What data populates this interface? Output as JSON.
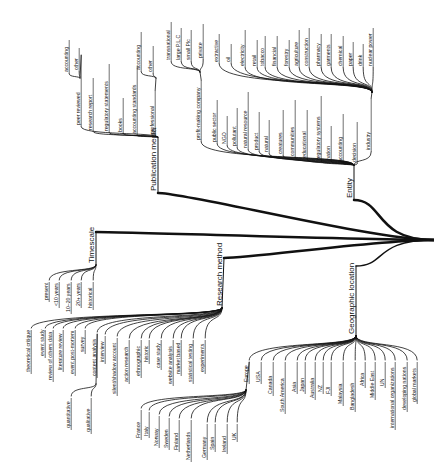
{
  "diagram": {
    "type": "mind-map-tree",
    "orientation": "rotated-90-ccw",
    "colors": {
      "line": "#111111",
      "background": "#ffffff",
      "text": "#111111"
    },
    "root": {
      "x": 434,
      "y": 240
    },
    "branches": [
      {
        "id": "publication-media",
        "label": "Publication media",
        "anchor": {
          "x": 158,
          "y": 193
        },
        "hub": {
          "x": 158,
          "y": 137
        },
        "trunk_width": 2.5,
        "children": [
          {
            "label": "peer reviewed",
            "x": 80,
            "top": 55,
            "bottom": 125,
            "children": [
              {
                "label": "accounting",
                "x": 68,
                "top": 40,
                "bottom": 72
              },
              {
                "label": "other",
                "x": 78,
                "top": 48,
                "bottom": 70
              }
            ],
            "subhub": {
              "x": 80,
              "y": 78
            }
          },
          {
            "label": "research report",
            "x": 92,
            "top": 78,
            "bottom": 130
          },
          {
            "label": "regulatory statements",
            "x": 108,
            "top": 64,
            "bottom": 131
          },
          {
            "label": "books",
            "x": 122,
            "top": 98,
            "bottom": 132
          },
          {
            "label": "accounting standards",
            "x": 136,
            "top": 66,
            "bottom": 134
          },
          {
            "label": "professional",
            "x": 154,
            "top": 90,
            "bottom": 134,
            "children": [
              {
                "label": "accounting",
                "x": 140,
                "top": 32,
                "bottom": 70
              },
              {
                "label": "other",
                "x": 152,
                "top": 46,
                "bottom": 72
              }
            ],
            "subhub": {
              "x": 156,
              "y": 78
            }
          }
        ]
      },
      {
        "id": "entity",
        "label": "Entity",
        "anchor": {
          "x": 354,
          "y": 200
        },
        "hub": {
          "x": 354,
          "y": 165
        },
        "trunk_width": 2.5,
        "children": [
          {
            "label": "profit-making company",
            "x": 200,
            "top": 80,
            "bottom": 140,
            "children": [
              {
                "label": "transnational",
                "x": 170,
                "top": 22,
                "bottom": 60
              },
              {
                "label": "large P.L.C",
                "x": 180,
                "top": 28,
                "bottom": 60
              },
              {
                "label": "small Plc",
                "x": 190,
                "top": 30,
                "bottom": 60
              },
              {
                "label": "private",
                "x": 202,
                "top": 24,
                "bottom": 58
              }
            ],
            "subhub": {
              "x": 200,
              "y": 72
            }
          },
          {
            "label": "public sector",
            "x": 216,
            "top": 100,
            "bottom": 142
          },
          {
            "label": "NGO",
            "x": 226,
            "top": 116,
            "bottom": 144
          },
          {
            "label": "pollutant",
            "x": 236,
            "top": 108,
            "bottom": 146
          },
          {
            "label": "natural resource",
            "x": 247,
            "top": 92,
            "bottom": 148
          },
          {
            "label": "product",
            "x": 258,
            "top": 112,
            "bottom": 150
          },
          {
            "label": "natural",
            "x": 268,
            "top": 120,
            "bottom": 152
          },
          {
            "label": "creatures",
            "x": 282,
            "top": 110,
            "bottom": 154
          },
          {
            "label": "communities",
            "x": 294,
            "top": 100,
            "bottom": 156
          },
          {
            "label": "educational",
            "x": 306,
            "top": 110,
            "bottom": 158
          },
          {
            "label": "regulatory systems",
            "x": 320,
            "top": 96,
            "bottom": 160
          },
          {
            "label": "nation",
            "x": 330,
            "top": 126,
            "bottom": 160
          },
          {
            "label": "accounting",
            "x": 342,
            "top": 114,
            "bottom": 162
          },
          {
            "label": "decision",
            "x": 356,
            "top": 122,
            "bottom": 162
          },
          {
            "label": "industry",
            "x": 370,
            "top": 98,
            "bottom": 150,
            "children": [
              {
                "label": "extractive",
                "x": 218,
                "top": 34,
                "bottom": 62
              },
              {
                "label": "oil",
                "x": 230,
                "top": 44,
                "bottom": 62
              },
              {
                "label": "electricity",
                "x": 244,
                "top": 30,
                "bottom": 66
              },
              {
                "label": "retail",
                "x": 256,
                "top": 40,
                "bottom": 66
              },
              {
                "label": "tobacco",
                "x": 264,
                "top": 36,
                "bottom": 66
              },
              {
                "label": "financial",
                "x": 276,
                "top": 36,
                "bottom": 66
              },
              {
                "label": "forestry",
                "x": 288,
                "top": 40,
                "bottom": 66
              },
              {
                "label": "agriculture",
                "x": 298,
                "top": 30,
                "bottom": 66
              },
              {
                "label": "construction",
                "x": 308,
                "top": 28,
                "bottom": 66
              },
              {
                "label": "pharmacy",
                "x": 320,
                "top": 34,
                "bottom": 66
              },
              {
                "label": "garments",
                "x": 330,
                "top": 34,
                "bottom": 66
              },
              {
                "label": "chemical",
                "x": 342,
                "top": 36,
                "bottom": 66
              },
              {
                "label": "paper",
                "x": 352,
                "top": 42,
                "bottom": 66
              },
              {
                "label": "drink",
                "x": 362,
                "top": 44,
                "bottom": 66
              },
              {
                "label": "nuclear power",
                "x": 372,
                "top": 28,
                "bottom": 66
              }
            ],
            "subhub": {
              "x": 372,
              "y": 92
            }
          }
        ]
      },
      {
        "id": "timescale",
        "label": "Timescale",
        "anchor": {
          "x": 96,
          "y": 232
        },
        "hub": {
          "x": 96,
          "y": 265
        },
        "trunk_width": 2.5,
        "children": [
          {
            "label": "present",
            "x": 48,
            "top": 282,
            "bottom": 300
          },
          {
            "label": "<10 years",
            "x": 58,
            "top": 282,
            "bottom": 306
          },
          {
            "label": "10–20 years",
            "x": 70,
            "top": 282,
            "bottom": 312
          },
          {
            "label": "20+ years",
            "x": 80,
            "top": 282,
            "bottom": 306
          },
          {
            "label": "historical",
            "x": 92,
            "top": 282,
            "bottom": 308
          }
        ]
      },
      {
        "id": "research-method",
        "label": "Research method",
        "anchor": {
          "x": 224,
          "y": 258
        },
        "hub": {
          "x": 222,
          "y": 308
        },
        "trunk_width": 2.5,
        "children": [
          {
            "label": "theoretical critique",
            "x": 30,
            "top": 330,
            "bottom": 372
          },
          {
            "label": "event study",
            "x": 44,
            "top": 330,
            "bottom": 356
          },
          {
            "label": "review of others data",
            "x": 52,
            "top": 330,
            "bottom": 380
          },
          {
            "label": "literature review",
            "x": 62,
            "top": 330,
            "bottom": 370
          },
          {
            "label": "event post-mortem",
            "x": 74,
            "top": 330,
            "bottom": 374
          },
          {
            "label": "survey",
            "x": 84,
            "top": 330,
            "bottom": 352
          },
          {
            "label": "content analysis",
            "x": 96,
            "top": 334,
            "bottom": 376,
            "children": [
              {
                "label": "quantitative",
                "x": 70,
                "top": 398,
                "bottom": 428
              },
              {
                "label": "qualitative",
                "x": 90,
                "top": 398,
                "bottom": 432
              }
            ],
            "subhub": {
              "x": 96,
              "y": 384
            }
          },
          {
            "label": "interview",
            "x": 104,
            "top": 336,
            "bottom": 362
          },
          {
            "label": "silent/shadow account",
            "x": 116,
            "top": 338,
            "bottom": 394
          },
          {
            "label": "action research",
            "x": 128,
            "top": 340,
            "bottom": 382
          },
          {
            "label": "ethnographic",
            "x": 140,
            "top": 340,
            "bottom": 376
          },
          {
            "label": "historic",
            "x": 148,
            "top": 340,
            "bottom": 362
          },
          {
            "label": "case study",
            "x": 160,
            "top": 340,
            "bottom": 368
          },
          {
            "label": "website analysis",
            "x": 172,
            "top": 340,
            "bottom": 384
          },
          {
            "label": "market based",
            "x": 180,
            "top": 340,
            "bottom": 374
          },
          {
            "label": "statistical testing",
            "x": 192,
            "top": 340,
            "bottom": 382
          },
          {
            "label": "experiments",
            "x": 204,
            "top": 340,
            "bottom": 372
          }
        ]
      },
      {
        "id": "geographic-location",
        "label": "Geographic location",
        "anchor": {
          "x": 356,
          "y": 266
        },
        "hub": {
          "x": 356,
          "y": 336
        },
        "trunk_width": 1.5,
        "children": [
          {
            "label": "Europe",
            "x": 248,
            "top": 362,
            "bottom": 382,
            "children": [
              {
                "label": "France",
                "x": 140,
                "top": 410,
                "bottom": 438
              },
              {
                "label": "Italy",
                "x": 148,
                "top": 412,
                "bottom": 436
              },
              {
                "label": "Norway",
                "x": 158,
                "top": 416,
                "bottom": 446
              },
              {
                "label": "Sweden",
                "x": 168,
                "top": 418,
                "bottom": 448
              },
              {
                "label": "Finland",
                "x": 178,
                "top": 420,
                "bottom": 450
              },
              {
                "label": "Netherlands",
                "x": 190,
                "top": 420,
                "bottom": 460
              },
              {
                "label": "Germany",
                "x": 206,
                "top": 424,
                "bottom": 458
              },
              {
                "label": "Spain",
                "x": 214,
                "top": 424,
                "bottom": 450
              },
              {
                "label": "Ireland",
                "x": 226,
                "top": 424,
                "bottom": 452
              },
              {
                "label": "UK",
                "x": 236,
                "top": 424,
                "bottom": 440
              }
            ],
            "subhub": {
              "x": 246,
              "y": 390
            }
          },
          {
            "label": "USA",
            "x": 260,
            "top": 362,
            "bottom": 382
          },
          {
            "label": "Canada",
            "x": 272,
            "top": 362,
            "bottom": 394
          },
          {
            "label": "South America",
            "x": 284,
            "top": 362,
            "bottom": 412
          },
          {
            "label": "Asia",
            "x": 296,
            "top": 362,
            "bottom": 392
          },
          {
            "label": "Japan",
            "x": 304,
            "top": 362,
            "bottom": 392
          },
          {
            "label": "Australia",
            "x": 314,
            "top": 362,
            "bottom": 398
          },
          {
            "label": "NZ",
            "x": 322,
            "top": 362,
            "bottom": 392
          },
          {
            "label": "FJI",
            "x": 330,
            "top": 362,
            "bottom": 394
          },
          {
            "label": "Malaysia",
            "x": 342,
            "top": 362,
            "bottom": 404
          },
          {
            "label": "Bangladesh",
            "x": 354,
            "top": 362,
            "bottom": 410
          },
          {
            "label": "Africa",
            "x": 364,
            "top": 362,
            "bottom": 386
          },
          {
            "label": "Middle East",
            "x": 374,
            "top": 362,
            "bottom": 398
          },
          {
            "label": "UN",
            "x": 384,
            "top": 362,
            "bottom": 386
          },
          {
            "label": "international organizations",
            "x": 394,
            "top": 362,
            "bottom": 428
          },
          {
            "label": "developing nations",
            "x": 406,
            "top": 362,
            "bottom": 410
          },
          {
            "label": "global markets",
            "x": 416,
            "top": 362,
            "bottom": 402
          }
        ]
      }
    ]
  }
}
